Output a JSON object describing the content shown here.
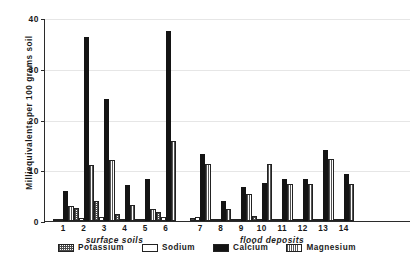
{
  "chart_data": {
    "type": "bar",
    "title": "",
    "xlabel": "",
    "ylabel": "Milliequivalents per 100 grams soil",
    "ylim": [
      0,
      40
    ],
    "yticks": [
      0,
      10,
      20,
      30,
      40
    ],
    "grid": true,
    "legend_position": "bottom",
    "categories": [
      "1",
      "2",
      "3",
      "4",
      "5",
      "6",
      "7",
      "8",
      "9",
      "10",
      "11",
      "12",
      "13",
      "14"
    ],
    "x_section_labels": [
      {
        "label": "surface soils",
        "categories": [
          "1",
          "2",
          "3",
          "4",
          "5",
          "6"
        ]
      },
      {
        "label": "flood deposits",
        "categories": [
          "7",
          "8",
          "9",
          "10",
          "11",
          "12",
          "13",
          "14"
        ]
      }
    ],
    "series": [
      {
        "name": "Potassium",
        "pattern": "cross-hatch",
        "values": [
          0.4,
          2.5,
          4.0,
          1.3,
          0.3,
          1.8,
          0.5,
          0.2,
          0.4,
          0.9,
          0.3,
          0.2,
          0.4,
          0.2
        ]
      },
      {
        "name": "Sodium",
        "pattern": "empty",
        "values": [
          0.2,
          0.6,
          0.7,
          0.1,
          0.1,
          0.7,
          0.8,
          0.1,
          0.3,
          0.1,
          0.1,
          0.1,
          0.1,
          0.2
        ]
      },
      {
        "name": "Calcium",
        "pattern": "solid-black",
        "values": [
          6.0,
          36.3,
          24.0,
          7.0,
          8.2,
          37.5,
          13.3,
          4.0,
          6.7,
          7.5,
          8.3,
          8.3,
          14.0,
          9.2
        ]
      },
      {
        "name": "Magnesium",
        "pattern": "vertical-lines",
        "values": [
          3.0,
          11.0,
          12.0,
          3.2,
          2.4,
          15.7,
          11.3,
          2.3,
          5.3,
          11.3,
          7.3,
          7.2,
          12.3,
          7.2
        ]
      }
    ]
  },
  "legend": {
    "items": [
      {
        "label": "Potassium"
      },
      {
        "label": "Sodium"
      },
      {
        "label": "Calcium"
      },
      {
        "label": "Magnesium"
      }
    ]
  },
  "colors": {
    "calcium": "#141414",
    "axis": "#2b2b2b",
    "grid": "#e6e6e6",
    "background": "#ffffff"
  }
}
